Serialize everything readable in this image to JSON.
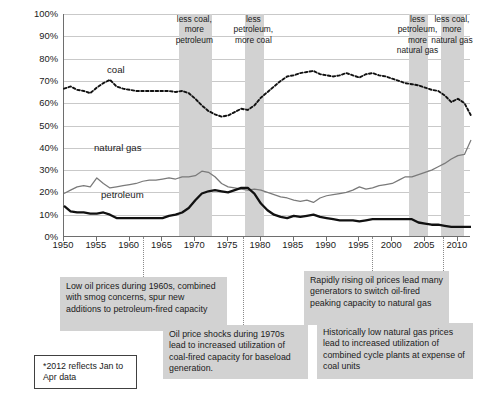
{
  "chart_data": {
    "type": "line",
    "title": "",
    "xlabel": "",
    "ylabel": "",
    "xlim": [
      1950,
      2012
    ],
    "ylim": [
      0,
      100
    ],
    "ytick_labels": [
      "100%",
      "90%",
      "80%",
      "70%",
      "60%",
      "50%",
      "40%",
      "30%",
      "20%",
      "10%",
      "0%"
    ],
    "ytick_values": [
      100,
      90,
      80,
      70,
      60,
      50,
      40,
      30,
      20,
      10,
      0
    ],
    "xtick_labels": [
      "1950",
      "1955",
      "1960",
      "1965",
      "1970",
      "1975",
      "1980",
      "1985",
      "1990",
      "1995",
      "2000",
      "2005",
      "2010"
    ],
    "xtick_values": [
      1950,
      1955,
      1960,
      1965,
      1970,
      1975,
      1980,
      1985,
      1990,
      1995,
      2000,
      2005,
      2010
    ],
    "grid": true,
    "legend_position": "inline-labels",
    "x": [
      1950,
      1951,
      1952,
      1953,
      1954,
      1955,
      1956,
      1957,
      1958,
      1959,
      1960,
      1961,
      1962,
      1963,
      1964,
      1965,
      1966,
      1967,
      1968,
      1969,
      1970,
      1971,
      1972,
      1973,
      1974,
      1975,
      1976,
      1977,
      1978,
      1979,
      1980,
      1981,
      1982,
      1983,
      1984,
      1985,
      1986,
      1987,
      1988,
      1989,
      1990,
      1991,
      1992,
      1993,
      1994,
      1995,
      1996,
      1997,
      1998,
      1999,
      2000,
      2001,
      2002,
      2003,
      2004,
      2005,
      2006,
      2007,
      2008,
      2009,
      2010,
      2011,
      2012
    ],
    "series": [
      {
        "name": "coal",
        "style": "dotted",
        "color": "#111111",
        "values": [
          66.5,
          67.5,
          66.0,
          65.5,
          64.5,
          67.0,
          69.0,
          70.5,
          67.5,
          66.5,
          66.0,
          65.5,
          65.5,
          65.5,
          65.5,
          65.5,
          65.5,
          65.0,
          65.5,
          64.5,
          62.0,
          59.0,
          56.5,
          55.0,
          54.0,
          54.5,
          56.0,
          57.5,
          57.0,
          59.0,
          62.5,
          65.0,
          67.5,
          70.0,
          72.0,
          72.5,
          73.5,
          74.0,
          74.5,
          73.0,
          72.5,
          72.0,
          72.5,
          73.5,
          72.5,
          71.5,
          73.0,
          73.5,
          72.5,
          72.0,
          71.0,
          70.0,
          69.0,
          68.5,
          68.0,
          67.0,
          66.0,
          65.5,
          63.5,
          60.5,
          62.0,
          60.0,
          54.5
        ]
      },
      {
        "name": "natural gas",
        "style": "solid",
        "color": "#7a7a7a",
        "values": [
          19.5,
          21.0,
          22.5,
          23.0,
          22.5,
          26.5,
          24.0,
          22.0,
          22.5,
          23.0,
          23.5,
          24.0,
          25.0,
          25.5,
          25.5,
          26.0,
          26.5,
          26.0,
          27.0,
          27.0,
          27.5,
          29.5,
          29.0,
          27.0,
          24.0,
          22.5,
          22.0,
          21.5,
          21.0,
          21.5,
          21.0,
          20.0,
          19.0,
          18.0,
          17.5,
          16.5,
          16.0,
          16.5,
          15.5,
          17.5,
          18.5,
          19.0,
          19.5,
          20.0,
          21.0,
          22.5,
          21.5,
          22.0,
          23.0,
          23.5,
          24.0,
          25.5,
          27.0,
          27.0,
          28.0,
          29.0,
          30.0,
          31.5,
          33.0,
          35.0,
          36.5,
          37.0,
          43.5
        ]
      },
      {
        "name": "petroleum",
        "style": "solid-bold",
        "color": "#111111",
        "values": [
          14.0,
          11.5,
          11.0,
          11.0,
          10.5,
          10.5,
          11.0,
          10.0,
          8.5,
          8.5,
          8.5,
          8.5,
          8.5,
          8.5,
          8.5,
          8.5,
          9.5,
          10.0,
          11.0,
          13.0,
          16.5,
          19.5,
          20.5,
          21.0,
          20.5,
          20.0,
          21.0,
          22.0,
          22.0,
          19.5,
          15.0,
          12.0,
          10.0,
          9.0,
          8.5,
          9.5,
          9.0,
          9.5,
          10.0,
          9.0,
          8.5,
          8.0,
          7.5,
          7.5,
          7.5,
          7.0,
          7.5,
          8.0,
          8.0,
          8.0,
          8.0,
          8.0,
          8.0,
          8.0,
          6.5,
          6.0,
          5.5,
          5.5,
          5.0,
          4.5,
          4.5,
          4.5,
          4.5
        ]
      }
    ],
    "series_labels": [
      {
        "name": "coal",
        "text": "coal"
      },
      {
        "name": "natural-gas",
        "text": "natural gas"
      },
      {
        "name": "petroleum",
        "text": "petroleum"
      }
    ],
    "shaded_bands": [
      {
        "id": "band-1",
        "start": 1967.5,
        "end": 1972.5,
        "label": "less coal, more petroleum"
      },
      {
        "id": "band-2",
        "start": 1977.5,
        "end": 1980.5,
        "label": "less petroleum, more coal"
      },
      {
        "id": "band-3",
        "start": 2002.5,
        "end": 2005.5,
        "label": "less petroleum, more natural gas"
      },
      {
        "id": "band-4",
        "start": 2007.5,
        "end": 2011.0,
        "label": "less coal, more natural gas"
      }
    ]
  },
  "annotations": [
    {
      "id": "anno-1960s",
      "text": "Low oil prices during 1960s, combined with smog concerns, spur new additions to petroleum-fired capacity"
    },
    {
      "id": "anno-1970s",
      "text": "Oil price shocks during 1970s lead to increased utilization of coal-fired capacity for baseload generation."
    },
    {
      "id": "anno-rising-oil",
      "text": "Rapidly rising oil prices lead many generators to switch oil-fired peaking capacity to natural gas"
    },
    {
      "id": "anno-low-gas",
      "text": "Historically low natural gas prices lead to increased utilization of combined cycle plants at expense of coal units"
    },
    {
      "id": "anno-footnote",
      "text": "*2012 reflects Jan to Apr data"
    }
  ],
  "colors": {
    "band_fill": "#d2d2d2",
    "gridline": "#c9c9c9",
    "axis": "#6e6e6e",
    "coal": "#111111",
    "natural_gas": "#7a7a7a",
    "petroleum": "#111111",
    "annotation_bg": "#d2d2d2",
    "text": "#1a1a1a"
  }
}
